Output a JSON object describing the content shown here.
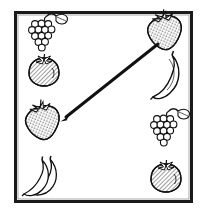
{
  "worksheet": {
    "type": "fruit-matching-exercise",
    "description": "Black and white line-drawing matching worksheet: four fruits in a left column and four fruits in a right column inside a rectangular frame, with one drawn line connecting a matching pair.",
    "frame": {
      "stroke_color": "#1a1a1a",
      "fill_color": "#ffffff",
      "x": 14,
      "y": 11,
      "width": 179,
      "height": 192,
      "stroke_width": 3
    },
    "columns": {
      "left": [
        {
          "index": 0,
          "icon": "grapes-icon",
          "label": "Grapes",
          "cx": 45,
          "cy": 33
        },
        {
          "index": 1,
          "icon": "tomato-icon",
          "label": "Tomato",
          "cx": 44,
          "cy": 72
        },
        {
          "index": 2,
          "icon": "strawberry-icon",
          "label": "Strawberry",
          "cx": 44,
          "cy": 123
        },
        {
          "index": 3,
          "icon": "bananas-icon",
          "label": "Bananas",
          "cx": 44,
          "cy": 177
        }
      ],
      "right": [
        {
          "index": 0,
          "icon": "strawberry-icon",
          "label": "Strawberry",
          "cx": 166,
          "cy": 33
        },
        {
          "index": 1,
          "icon": "banana-icon",
          "label": "Banana",
          "cx": 168,
          "cy": 76
        },
        {
          "index": 2,
          "icon": "grapes-icon",
          "label": "Grapes",
          "cx": 167,
          "cy": 128
        },
        {
          "index": 3,
          "icon": "tomato-icon",
          "label": "Tomato",
          "cx": 166,
          "cy": 178
        }
      ]
    },
    "connections": [
      {
        "id": "match-strawberry",
        "from": {
          "side": "left",
          "index": 2,
          "label": "Strawberry",
          "x": 66,
          "y": 117
        },
        "to": {
          "side": "right",
          "index": 0,
          "label": "Strawberry",
          "x": 158,
          "y": 44
        },
        "stroke_color": "#111111",
        "stroke_width": 3
      }
    ],
    "colors": {
      "ink": "#111111",
      "paper": "#ffffff",
      "shading": "#5a5a5a",
      "page_background": "#ffffff"
    }
  }
}
